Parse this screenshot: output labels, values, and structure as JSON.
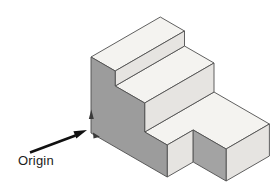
{
  "figure": {
    "origin_label": "Origin",
    "colors": {
      "background": "#ffffff",
      "top_face": "#f4f3f0",
      "side_face_light": "#e6e4e1",
      "side_face_dark": "#9c9c9c",
      "side_face_notch": "#a3a3a3",
      "outline": "#4f4f4f",
      "arrow": "#111111",
      "label_text": "#1b1b1b",
      "axis_marker": "#3a3a3a"
    },
    "faces": [
      {
        "name": "top-step-top-face",
        "shade": "top_face",
        "points": [
          [
            91,
            57
          ],
          [
            160.3,
            17
          ],
          [
            184.5,
            31
          ],
          [
            115.2,
            71
          ]
        ]
      },
      {
        "name": "mid-step-top-face",
        "shade": "top_face",
        "points": [
          [
            115.2,
            86
          ],
          [
            184.5,
            46
          ],
          [
            214,
            63
          ],
          [
            144.7,
            103
          ]
        ]
      },
      {
        "name": "base-top-face",
        "shade": "top_face",
        "points": [
          [
            144.7,
            132
          ],
          [
            214,
            92
          ],
          [
            269.4,
            124
          ],
          [
            226.1,
            149
          ],
          [
            193.2,
            130
          ],
          [
            167.2,
            145
          ]
        ]
      },
      {
        "name": "top-step-front-face",
        "shade": "side_face_light",
        "points": [
          [
            115.2,
            71
          ],
          [
            184.5,
            31
          ],
          [
            184.5,
            46
          ],
          [
            115.2,
            86
          ]
        ]
      },
      {
        "name": "mid-step-front-face",
        "shade": "side_face_light",
        "points": [
          [
            144.7,
            103
          ],
          [
            214,
            63
          ],
          [
            214,
            92
          ],
          [
            144.7,
            132
          ]
        ]
      },
      {
        "name": "notch-front-face",
        "shade": "side_face_light",
        "points": [
          [
            167.2,
            145
          ],
          [
            193.2,
            130
          ],
          [
            193.2,
            162
          ],
          [
            167.2,
            177
          ]
        ]
      },
      {
        "name": "base-front-face",
        "shade": "side_face_light",
        "points": [
          [
            226.1,
            149
          ],
          [
            269.4,
            124
          ],
          [
            269.4,
            156
          ],
          [
            226.1,
            181
          ]
        ]
      },
      {
        "name": "left-profile-face",
        "shade": "side_face_dark",
        "points": [
          [
            91,
            57
          ],
          [
            115.2,
            71
          ],
          [
            115.2,
            86
          ],
          [
            144.7,
            103
          ],
          [
            144.7,
            132
          ],
          [
            167.2,
            145
          ],
          [
            167.2,
            177
          ],
          [
            91,
            133
          ]
        ]
      },
      {
        "name": "notch-side-face",
        "shade": "side_face_notch",
        "points": [
          [
            193.2,
            130
          ],
          [
            226.1,
            149
          ],
          [
            226.1,
            181
          ],
          [
            193.2,
            162
          ]
        ]
      }
    ],
    "origin_arrow": {
      "shaft_from": [
        30,
        152.5
      ],
      "shaft_to": [
        75.5,
        135.5
      ],
      "head_points": [
        [
          87,
          130
        ],
        [
          76.3,
          138.6
        ],
        [
          73.4,
          131.2
        ]
      ]
    },
    "axis_markers": [
      {
        "name": "z-axis-arrowhead-icon",
        "points": [
          [
            88.8,
            119
          ],
          [
            91.3,
            109.5
          ],
          [
            93.8,
            119
          ]
        ]
      },
      {
        "name": "x-axis-arrowhead-icon",
        "points": [
          [
            93,
            132.5
          ],
          [
            99.8,
            136.8
          ],
          [
            93.5,
            138.5
          ]
        ]
      }
    ]
  }
}
